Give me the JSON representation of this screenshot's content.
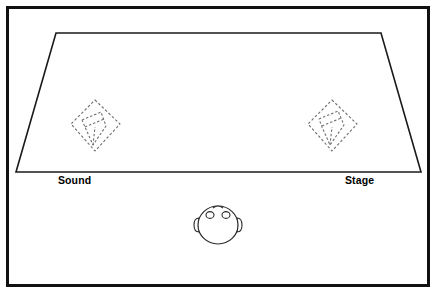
{
  "diagram": {
    "background_color": "#ffffff",
    "frame": {
      "name": "outer-frame",
      "color": "#111111",
      "x": 6,
      "y": 6,
      "width": 424,
      "height": 281
    },
    "floor": {
      "name": "room-floor-trapezoid",
      "fill": "#ffffff",
      "stroke": "#1a1a1a",
      "points": "56,33 381,33 421,172 16,172"
    },
    "labels": [
      {
        "id": "sound",
        "text": "Sound",
        "x": 58,
        "y": 174
      },
      {
        "id": "stage",
        "text": "Stage",
        "x": 345,
        "y": 174
      }
    ],
    "fixtures": [
      {
        "id": "left-fixture",
        "name": "dashed-diamond-left",
        "stroke": "#6e6e6e",
        "center_x": 95,
        "center_y": 124,
        "outline": "95,100 120,124 95,151 71,124",
        "inner": "86,116 104,113 108,128 92,144 86,127"
      },
      {
        "id": "right-fixture",
        "name": "dashed-diamond-right",
        "stroke": "#6e6e6e",
        "center_x": 332,
        "center_y": 124,
        "outline": "332,100 357,124 332,151 308,124"
      }
    ],
    "figure": {
      "id": "listener",
      "name": "person-head-top-view",
      "center_x": 218,
      "center_y": 225,
      "head_radius_x": 20,
      "head_radius_y": 19,
      "stroke": "#2a2a2a",
      "fill": "#ffffff"
    },
    "colors": {
      "frame": "#111111",
      "floor_stroke": "#1a1a1a",
      "fixture_stroke": "#6e6e6e",
      "figure_stroke": "#2a2a2a",
      "label_text": "#000000",
      "background": "#ffffff"
    }
  }
}
